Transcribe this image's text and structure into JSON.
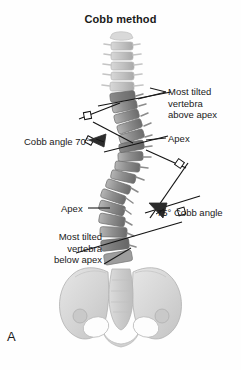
{
  "figure": {
    "title": "Cobb method",
    "panel_letter": "A",
    "background_color": "#fefefe",
    "text_color": "#1a1a1a"
  },
  "labels": {
    "most_tilted_above": "Most tilted\nvertebra\nabove apex",
    "apex_upper": "Apex",
    "cobb_angle_upper": "Cobb angle 70°",
    "apex_lower": "Apex",
    "cobb_angle_lower": "75° Cobb angle",
    "most_tilted_below": "Most tilted\nvertebra\nbelow apex"
  },
  "measurements": {
    "upper_cobb_angle": "70°",
    "lower_cobb_angle": "75°"
  },
  "anatomy": {
    "spine_label": "scoliotic-vertebral-column",
    "pelvis_label": "pelvis",
    "vertebra_fill_light": "#c9c9c9",
    "vertebra_fill_mid": "#9a9a9a",
    "vertebra_fill_dark": "#6f6f6f",
    "pelvis_fill": "#dcdcdc",
    "outline_color": "#8a8a8a",
    "construction_line_color": "#141414"
  }
}
